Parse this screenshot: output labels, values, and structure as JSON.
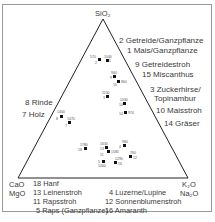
{
  "axes": {
    "top": "SiO₂",
    "bottom_left_1": "CaO",
    "bottom_left_2": "MgO",
    "bottom_right_1": "K₂O",
    "bottom_right_2": "Na₂O"
  },
  "right_labels": [
    "2 Getreide/Ganzpflanze",
    "1 Mais/Ganzpflanze",
    "9 Getreidestroh",
    "15 Miscanthus",
    "3 Zuckerhirse/",
    "Topinambur",
    "10 Maisstroh",
    "14 Gräser"
  ],
  "left_labels": [
    "8 Rinde",
    "7 Holz"
  ],
  "bottom_labels": {
    "col1": [
      "18 Hanf",
      "13 Leinenstroh",
      "11 Rapsstroh",
      "5 Raps (Ganzpflanze)"
    ],
    "col2": [
      "4 Luzerne/Lupine",
      "12 Sonnenblumenstroh",
      "16 Amaranth"
    ]
  },
  "points": [
    {
      "id": "2",
      "value": "570"
    },
    {
      "id": "1",
      "value": "1040"
    },
    {
      "id": "9",
      "value": "940"
    },
    {
      "id": "15",
      "value": "860"
    },
    {
      "id": "3",
      "value": "1130"
    },
    {
      "id": "10",
      "value": "1030"
    },
    {
      "id": "14",
      "value": "970"
    },
    {
      "id": "8",
      "value": "1400"
    },
    {
      "id": "7",
      "value": "1470"
    },
    {
      "id": "18",
      "value": "1780"
    },
    {
      "id": "13",
      "value": "1630"
    },
    {
      "id": "11",
      "value": "1580"
    },
    {
      "id": "4",
      "value": "980"
    },
    {
      "id": "12",
      "value": "760"
    },
    {
      "id": "5",
      "value": "1400"
    },
    {
      "id": "16",
      "value": "1290"
    }
  ]
}
